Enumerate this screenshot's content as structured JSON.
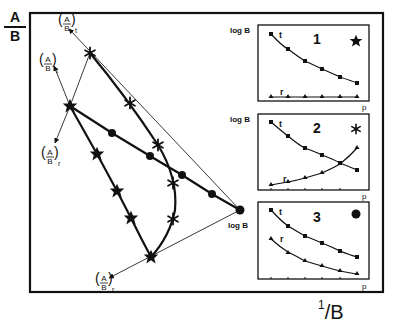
{
  "axes": {
    "y_label": {
      "numerator": "A",
      "denominator": "B"
    },
    "x_label": {
      "numerator": "1",
      "denominator": "B"
    }
  },
  "main_diagram": {
    "vectors": [
      {
        "label_num": "A",
        "label_den": "B",
        "subscript": "t",
        "id": "top-t"
      },
      {
        "label_num": "A",
        "label_den": "B",
        "subscript": "t",
        "id": "mid-t"
      },
      {
        "label_num": "A",
        "label_den": "B",
        "subscript": "r",
        "id": "mid-r"
      },
      {
        "label_num": "A",
        "label_den": "B",
        "subscript": "r",
        "id": "bottom-r"
      }
    ],
    "origin_label": "log B",
    "paths": [
      {
        "name": "case-1-stars",
        "marker": "star"
      },
      {
        "name": "case-2-asterisks",
        "marker": "asterisk"
      },
      {
        "name": "case-3-circles",
        "marker": "circle"
      }
    ]
  },
  "insets": [
    {
      "number": "1",
      "marker": "star",
      "y_label": "log B",
      "x_label": "p",
      "series": [
        "t",
        "r"
      ]
    },
    {
      "number": "2",
      "marker": "asterisk",
      "y_label": "log B",
      "x_label": "p",
      "series": [
        "t",
        "r"
      ]
    },
    {
      "number": "3",
      "marker": "circle",
      "y_label": "log B",
      "x_label": "p",
      "series": [
        "t",
        "r"
      ]
    }
  ],
  "colors": {
    "ink": "#111111",
    "background": "#ffffff"
  }
}
